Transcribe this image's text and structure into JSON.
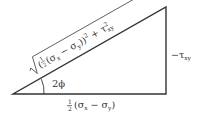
{
  "diagram": {
    "type": "right-triangle",
    "hypotenuse": {
      "label_prefix": "(",
      "frac_num": "1",
      "frac_den": "2",
      "label_body": "(σx − σy))² + τ²xy",
      "sigma": "σ",
      "sub_x": "x",
      "sub_y": "y",
      "tau": "τ",
      "sub_xy": "xy",
      "minus": "−",
      "plus": "+",
      "sq": "2"
    },
    "angle": {
      "label": "2ϕ"
    },
    "base": {
      "frac_num": "1",
      "frac_den": "2",
      "open": "(σ",
      "sub_x": "x",
      "minus": " − σ",
      "sub_y": "y",
      "close": ")"
    },
    "vertical_side": {
      "label": "−τ",
      "sub": "xy"
    },
    "colors": {
      "line": "#333333",
      "text": "#333333",
      "background": "#ffffff"
    }
  }
}
